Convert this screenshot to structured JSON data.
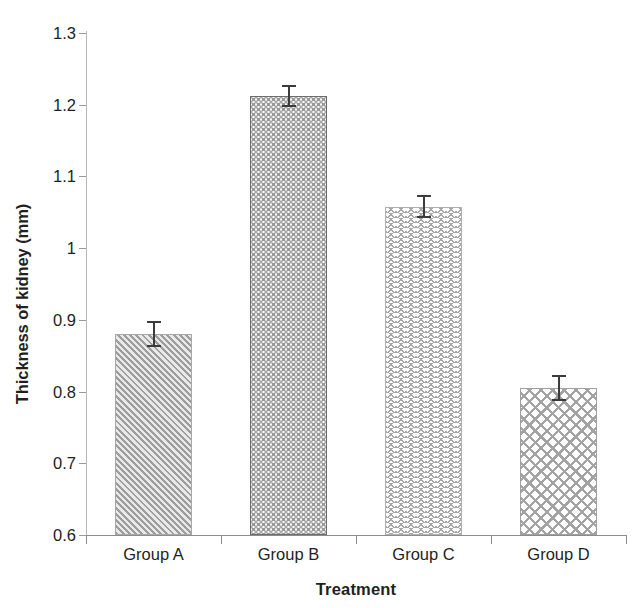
{
  "chart_data": {
    "type": "bar",
    "title": "",
    "xlabel": "Treatment",
    "ylabel": "Thickness of kidney (mm)",
    "categories": [
      "Group A",
      "Group B",
      "Group C",
      "Group D"
    ],
    "values": [
      0.88,
      1.212,
      1.058,
      0.805
    ],
    "errors": [
      0.018,
      0.015,
      0.016,
      0.018
    ],
    "ylim": [
      0.6,
      1.3
    ],
    "ytick_labels": [
      "1.3",
      "1.2",
      "1.1",
      "1",
      "0.9",
      "0.8",
      "0.7",
      "0.6"
    ],
    "ytick_values": [
      1.3,
      1.2,
      1.1,
      1.0,
      0.9,
      0.8,
      0.7,
      0.6
    ],
    "grid": false,
    "legend": false,
    "series": [
      {
        "name": "Thickness of kidney (mm)",
        "values": [
          0.88,
          1.212,
          1.058,
          0.805
        ],
        "errors": [
          0.018,
          0.015,
          0.016,
          0.018
        ],
        "fill_patterns": [
          "diagonal-hatch",
          "dots",
          "zigzag",
          "crosshatch"
        ]
      }
    ],
    "colors": {
      "bar_fill": "#ffffff",
      "bar_pattern": "#a0a0a0",
      "bar_border": "#8c8c8c",
      "axis": "#8c8c8c",
      "text": "#231f20",
      "error_bar": "#3b3b3b"
    }
  },
  "axes": {
    "y_title": "Thickness of kidney (mm)",
    "x_title": "Treatment",
    "y_ticks": [
      {
        "label": "1.3"
      },
      {
        "label": "1.2"
      },
      {
        "label": "1.1"
      },
      {
        "label": "1"
      },
      {
        "label": "0.9"
      },
      {
        "label": "0.8"
      },
      {
        "label": "0.7"
      },
      {
        "label": "0.6"
      }
    ],
    "x_ticks": [
      {
        "label": "Group A"
      },
      {
        "label": "Group B"
      },
      {
        "label": "Group C"
      },
      {
        "label": "Group D"
      }
    ]
  }
}
